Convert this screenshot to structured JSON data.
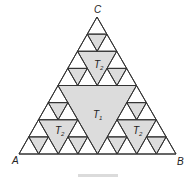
{
  "figure": {
    "vertices": {
      "A": {
        "label": "A",
        "x": 19,
        "y": 154
      },
      "B": {
        "label": "B",
        "x": 176,
        "y": 154
      },
      "C": {
        "label": "C",
        "x": 97,
        "y": 17
      }
    },
    "depth": 3,
    "colors": {
      "stroke": "#333333",
      "fill": "#dcdcdc",
      "background": "#ffffff"
    },
    "region_labels": [
      {
        "text": "T",
        "sub": "1",
        "x": 93,
        "y": 118
      },
      {
        "text": "T",
        "sub": "2",
        "x": 94,
        "y": 68
      },
      {
        "text": "T",
        "sub": "2",
        "x": 55,
        "y": 134
      },
      {
        "text": "T",
        "sub": "2",
        "x": 133,
        "y": 134
      }
    ]
  }
}
